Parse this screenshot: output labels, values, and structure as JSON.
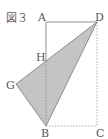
{
  "figure": {
    "caption": "図３",
    "points": {
      "A": {
        "label": "A",
        "x": 46,
        "y": 22
      },
      "D": {
        "label": "D",
        "x": 97,
        "y": 22
      },
      "B": {
        "label": "B",
        "x": 46,
        "y": 126
      },
      "C": {
        "label": "C",
        "x": 97,
        "y": 126
      },
      "H": {
        "label": "H",
        "x": 46,
        "y": 61
      },
      "G": {
        "label": "G",
        "x": 16,
        "y": 84
      }
    },
    "shaded_polygon": [
      "G",
      "D",
      "B"
    ],
    "colors": {
      "fill": "#bdbdbd",
      "line": "#777777",
      "dashed": "#999999"
    }
  }
}
